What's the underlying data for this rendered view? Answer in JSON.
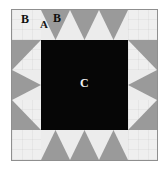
{
  "diagram": {
    "type": "quilt-block-sawtooth-star",
    "title": "",
    "grid": {
      "columns": 5,
      "rows": 5
    },
    "labels": {
      "corner_square": "B",
      "geese_gray_triangle": "A",
      "geese_light_triangle": "B",
      "center_square": "C"
    },
    "colors": {
      "light_fabric": "#efefef",
      "light_fabric_alt": "#ececec",
      "medium_gray_fabric": "#9a9a9a",
      "dark_center_fabric": "#060606",
      "outline": "#8f8f8f",
      "background": "#ffffff",
      "label_dark": "#101010",
      "label_light": "#f2f2f2"
    },
    "pieces": [
      {
        "name": "A",
        "shape": "triangle",
        "fabric": "medium_gray_fabric",
        "count": 16
      },
      {
        "name": "B",
        "shape": "triangle-and-square",
        "fabric": "light_fabric",
        "count": 20
      },
      {
        "name": "C",
        "shape": "square",
        "fabric": "dark_center_fabric",
        "count": 1
      }
    ],
    "cells": [
      {
        "r": 1,
        "c": 1,
        "kind": "corner-square",
        "fabric": "light"
      },
      {
        "r": 1,
        "c": 2,
        "kind": "flying-geese-up",
        "fabric": "gray"
      },
      {
        "r": 1,
        "c": 3,
        "kind": "flying-geese-up",
        "fabric": "gray"
      },
      {
        "r": 1,
        "c": 4,
        "kind": "flying-geese-up",
        "fabric": "gray"
      },
      {
        "r": 1,
        "c": 5,
        "kind": "corner-square",
        "fabric": "light"
      },
      {
        "r": 2,
        "c": 1,
        "kind": "half-square-triangle-tl",
        "fabric": "light"
      },
      {
        "r": 2,
        "c": 2,
        "kind": "center",
        "fabric": "black"
      },
      {
        "r": 2,
        "c": 3,
        "kind": "center",
        "fabric": "black"
      },
      {
        "r": 2,
        "c": 4,
        "kind": "center",
        "fabric": "black"
      },
      {
        "r": 2,
        "c": 5,
        "kind": "half-square-triangle-tr",
        "fabric": "light"
      },
      {
        "r": 3,
        "c": 1,
        "kind": "flying-geese-right",
        "fabric": "gray"
      },
      {
        "r": 3,
        "c": 2,
        "kind": "center",
        "fabric": "black"
      },
      {
        "r": 3,
        "c": 3,
        "kind": "center",
        "fabric": "black"
      },
      {
        "r": 3,
        "c": 4,
        "kind": "center",
        "fabric": "black"
      },
      {
        "r": 3,
        "c": 5,
        "kind": "flying-geese-left",
        "fabric": "gray"
      },
      {
        "r": 4,
        "c": 1,
        "kind": "half-square-triangle-bl",
        "fabric": "light"
      },
      {
        "r": 4,
        "c": 2,
        "kind": "center",
        "fabric": "black"
      },
      {
        "r": 4,
        "c": 3,
        "kind": "center",
        "fabric": "black"
      },
      {
        "r": 4,
        "c": 4,
        "kind": "center",
        "fabric": "black"
      },
      {
        "r": 4,
        "c": 5,
        "kind": "half-square-triangle-br",
        "fabric": "light"
      },
      {
        "r": 5,
        "c": 1,
        "kind": "corner-square",
        "fabric": "light"
      },
      {
        "r": 5,
        "c": 2,
        "kind": "flying-geese-down",
        "fabric": "gray"
      },
      {
        "r": 5,
        "c": 3,
        "kind": "flying-geese-down",
        "fabric": "gray"
      },
      {
        "r": 5,
        "c": 4,
        "kind": "flying-geese-down",
        "fabric": "gray"
      },
      {
        "r": 5,
        "c": 5,
        "kind": "corner-square",
        "fabric": "light"
      }
    ]
  }
}
